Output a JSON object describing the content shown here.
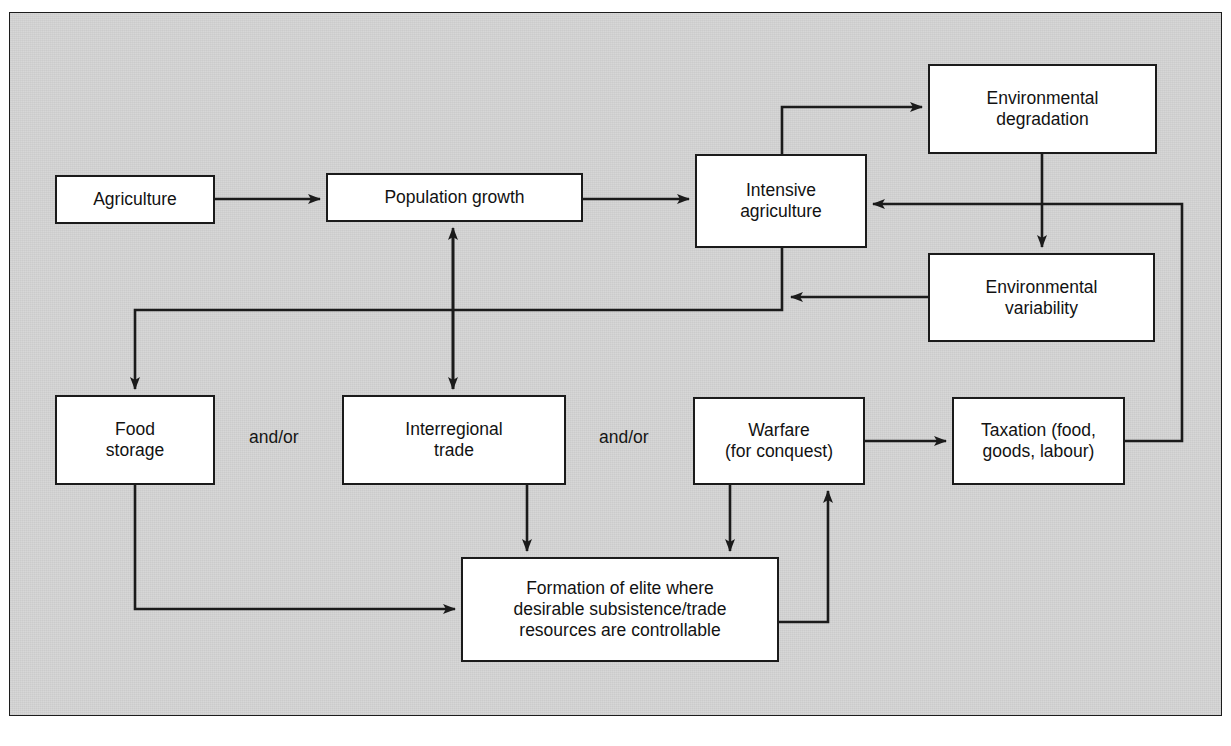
{
  "diagram": {
    "panel": {
      "background": "#d6d6d6",
      "border_color": "#1c1c1c"
    },
    "node_style": {
      "fill": "#ffffff",
      "stroke": "#1b1b1b",
      "text_color": "#121212"
    },
    "connector_color": "#1b1b1b",
    "nodes": [
      {
        "id": "agriculture",
        "label": "Agriculture",
        "x": 55,
        "y": 175,
        "w": 160,
        "h": 49
      },
      {
        "id": "population",
        "label": "Population growth",
        "x": 326,
        "y": 173,
        "w": 257,
        "h": 49
      },
      {
        "id": "intensive",
        "label": "Intensive\nagriculture",
        "x": 695,
        "y": 154,
        "w": 172,
        "h": 94
      },
      {
        "id": "degradation",
        "label": "Environmental\ndegradation",
        "x": 928,
        "y": 64,
        "w": 229,
        "h": 90
      },
      {
        "id": "variability",
        "label": "Environmental\nvariability",
        "x": 928,
        "y": 253,
        "w": 227,
        "h": 89
      },
      {
        "id": "foodstorage",
        "label": "Food\nstorage",
        "x": 55,
        "y": 395,
        "w": 160,
        "h": 90
      },
      {
        "id": "trade",
        "label": "Interregional\ntrade",
        "x": 342,
        "y": 395,
        "w": 224,
        "h": 90
      },
      {
        "id": "warfare",
        "label": "Warfare\n(for conquest)",
        "x": 693,
        "y": 397,
        "w": 172,
        "h": 88
      },
      {
        "id": "taxation",
        "label": "Taxation (food,\ngoods, labour)",
        "x": 952,
        "y": 397,
        "w": 173,
        "h": 88
      },
      {
        "id": "elite",
        "label": "Formation of elite where\ndesirable subsistence/trade\nresources are controllable",
        "x": 461,
        "y": 557,
        "w": 318,
        "h": 105
      }
    ],
    "connector_labels": [
      {
        "id": "andor-1",
        "text": "and/or",
        "x": 249,
        "y": 427
      },
      {
        "id": "andor-2",
        "text": "and/or",
        "x": 599,
        "y": 427
      }
    ],
    "edges": [
      {
        "id": "agriculture-to-population",
        "from": "agriculture",
        "to": "population",
        "kind": "arrow"
      },
      {
        "id": "population-to-intensive",
        "from": "population",
        "to": "intensive",
        "kind": "arrow"
      },
      {
        "id": "intensive-to-degradation",
        "from": "intensive",
        "to": "degradation",
        "kind": "arrow"
      },
      {
        "id": "degradation-to-variability",
        "from": "degradation",
        "to": "variability",
        "kind": "arrow"
      },
      {
        "id": "variability-to-intensive",
        "from": "variability",
        "to": "intensive",
        "kind": "arrow"
      },
      {
        "id": "intensive-to-foodstorage",
        "from": "intensive",
        "to": "foodstorage",
        "kind": "arrow"
      },
      {
        "id": "intensive-to-trade",
        "from": "intensive",
        "to": "trade",
        "kind": "arrow"
      },
      {
        "id": "trade-to-population",
        "from": "trade",
        "to": "population",
        "kind": "arrow"
      },
      {
        "id": "intensive-to-warfare",
        "from": "intensive",
        "to": "warfare",
        "kind": "arrow"
      },
      {
        "id": "foodstorage-to-elite",
        "from": "foodstorage",
        "to": "elite",
        "kind": "arrow"
      },
      {
        "id": "trade-to-elite",
        "from": "trade",
        "to": "elite",
        "kind": "arrow"
      },
      {
        "id": "warfare-to-elite",
        "from": "warfare",
        "to": "elite",
        "kind": "arrow"
      },
      {
        "id": "elite-to-warfare",
        "from": "elite",
        "to": "warfare",
        "kind": "arrow"
      },
      {
        "id": "warfare-to-taxation",
        "from": "warfare",
        "to": "taxation",
        "kind": "arrow"
      },
      {
        "id": "taxation-to-intensive",
        "from": "taxation",
        "to": "intensive",
        "kind": "arrow"
      }
    ]
  }
}
